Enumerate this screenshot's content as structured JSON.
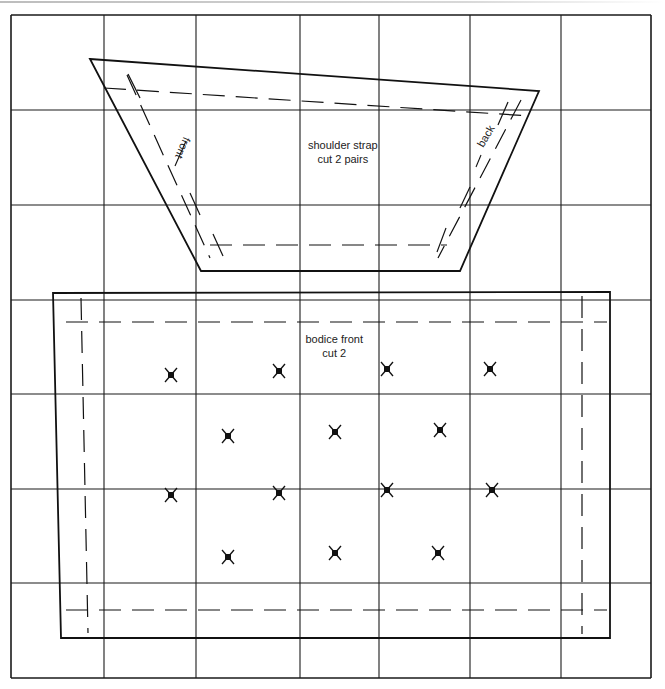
{
  "diagram": {
    "type": "sewing-pattern-grid",
    "colors": {
      "line": "#111111",
      "grid": "#1a1a1a",
      "background": "#ffffff",
      "text": "#222222"
    },
    "grid": {
      "x": [
        11,
        104,
        196,
        300,
        379,
        470,
        561,
        651
      ],
      "y": [
        15,
        110,
        205,
        300,
        394,
        489,
        583,
        678
      ]
    },
    "pieces": [
      {
        "id": "shoulder-strap",
        "label_line1": "shoulder strap",
        "label_line2": "cut 2 pairs",
        "label_pos": [
          343,
          152
        ],
        "outline": [
          [
            90,
            59
          ],
          [
            539,
            91
          ],
          [
            460,
            271
          ],
          [
            201,
            271
          ]
        ],
        "seam_lines": [
          [
            [
              104,
              88
            ],
            [
              530,
              116
            ]
          ],
          [
            [
              210,
              245
            ],
            [
              447,
              245
            ]
          ],
          [
            [
              127,
              75
            ],
            [
              210,
              258
            ]
          ],
          [
            [
              521,
              100
            ],
            [
              438,
              258
            ]
          ]
        ],
        "seam_ticks": [
          [
            [
              128,
              74
            ],
            [
              140,
              98
            ]
          ],
          [
            [
              508,
              102
            ],
            [
              498,
              125
            ]
          ],
          [
            [
              213,
              234
            ],
            [
              223,
              256
            ]
          ],
          [
            [
              446,
              228
            ],
            [
              437,
              252
            ]
          ],
          [
            [
              190,
              193
            ],
            [
              200,
              215
            ]
          ],
          [
            [
              470,
              187
            ],
            [
              460,
              208
            ]
          ]
        ],
        "grain_labels": [
          {
            "text": "front",
            "pos": [
              183,
              148
            ],
            "rotate": 113,
            "underline": [
              [
                186,
                141
              ],
              [
                175,
                166
              ]
            ]
          },
          {
            "text": "back",
            "pos": [
              485,
              136
            ],
            "rotate": -60,
            "underline": [
              [
                481,
                155
              ],
              [
                476,
                167
              ]
            ]
          }
        ]
      },
      {
        "id": "bodice-front",
        "label_line1": "bodice front",
        "label_line2": "cut 2",
        "label_pos": [
          334,
          346
        ],
        "outline": [
          [
            53,
            293
          ],
          [
            610,
            292
          ],
          [
            610,
            638
          ],
          [
            61,
            638
          ]
        ],
        "seam_lines": [
          [
            [
              66,
              322
            ],
            [
              607,
              322
            ]
          ],
          [
            [
              66,
              610
            ],
            [
              607,
              610
            ]
          ],
          [
            [
              81,
              298
            ],
            [
              88,
              633
            ]
          ],
          [
            [
              582,
              296
            ],
            [
              582,
              634
            ]
          ]
        ]
      }
    ],
    "marks": [
      [
        171,
        375
      ],
      [
        279,
        371
      ],
      [
        387,
        369
      ],
      [
        490,
        369
      ],
      [
        228,
        436
      ],
      [
        335,
        432
      ],
      [
        440,
        430
      ],
      [
        171,
        495
      ],
      [
        279,
        493
      ],
      [
        387,
        490
      ],
      [
        492,
        490
      ],
      [
        228,
        557
      ],
      [
        335,
        553
      ],
      [
        438,
        553
      ]
    ]
  }
}
